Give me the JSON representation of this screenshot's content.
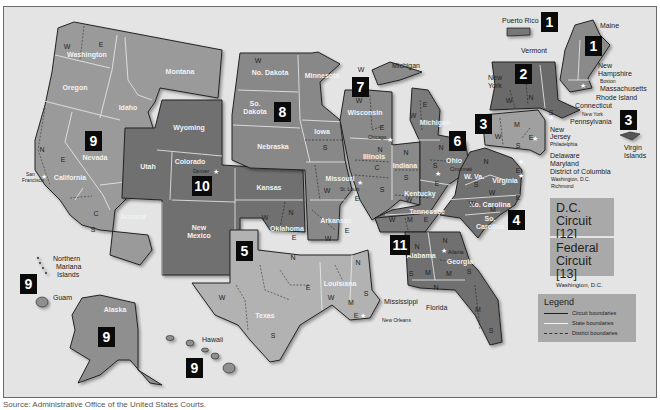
{
  "map": {
    "title": "U.S. Federal Judicial Circuits",
    "colors": {
      "background": "#e4e4e4",
      "circuit_dark": "#6f6f6f",
      "circuit_mid": "#8a8a8a",
      "circuit_light": "#a8a8a8",
      "circuit_boundary": "#222222",
      "state_boundary": "#eeeeee",
      "badge": "#0a0a0a"
    },
    "circuit_badges": [
      {
        "number": "1",
        "location": "Puerto Rico"
      },
      {
        "number": "1",
        "location": "New England"
      },
      {
        "number": "2",
        "location": "New York"
      },
      {
        "number": "3",
        "location": "Pennsylvania"
      },
      {
        "number": "3",
        "location": "Virgin Islands"
      },
      {
        "number": "4",
        "location": "So. Carolina"
      },
      {
        "number": "5",
        "location": "Texas"
      },
      {
        "number": "6",
        "location": "Ohio"
      },
      {
        "number": "7",
        "location": "Wisconsin"
      },
      {
        "number": "8",
        "location": "So. Dakota"
      },
      {
        "number": "9",
        "location": "Nevada"
      },
      {
        "number": "9",
        "location": "Northern Mariana Islands"
      },
      {
        "number": "9",
        "location": "Alaska"
      },
      {
        "number": "9",
        "location": "Hawaii"
      },
      {
        "number": "10",
        "location": "Colorado"
      },
      {
        "number": "11",
        "location": "Alabama"
      }
    ],
    "states": {
      "washington": "Washington",
      "oregon": "Oregon",
      "california": "California",
      "nevada": "Nevada",
      "idaho": "Idaho",
      "montana": "Montana",
      "arizona": "Arizona",
      "alaska": "Alaska",
      "hawaii": "Hawaii",
      "wyoming": "Wyoming",
      "utah": "Utah",
      "colorado": "Colorado",
      "new_mexico_1": "New",
      "new_mexico_2": "Mexico",
      "kansas": "Kansas",
      "oklahoma": "Oklahoma",
      "north_dakota": "No. Dakota",
      "south_dakota_1": "So.",
      "south_dakota_2": "Dakota",
      "nebraska": "Nebraska",
      "minnesota": "Minnesota",
      "iowa": "Iowa",
      "missouri": "Missouri",
      "arkansas": "Arkansas",
      "texas": "Texas",
      "louisiana": "Louisiana",
      "mississippi": "Mississippi",
      "wisconsin": "Wisconsin",
      "illinois": "Illinois",
      "indiana": "Indiana",
      "michigan": "Michigan",
      "michigan_up": "Michigan",
      "ohio": "Ohio",
      "kentucky": "Kentucky",
      "tennessee": "Tennessee",
      "west_virginia": "W. Va.",
      "virginia": "Virginia",
      "north_carolina": "No. Carolina",
      "south_carolina_1": "So.",
      "south_carolina_2": "Carolina",
      "alabama": "Alabama",
      "georgia": "Georgia",
      "florida": "Florida",
      "new_york_1": "New",
      "new_york_2": "York",
      "vermont": "Vermont",
      "maine": "Maine",
      "new_hampshire_1": "New",
      "new_hampshire_2": "Hampshire",
      "massachusetts": "Massachusetts",
      "rhode_island": "Rhode Island",
      "connecticut": "Connecticut",
      "pennsylvania": "Pennsylvania",
      "new_jersey_1": "New",
      "new_jersey_2": "Jersey",
      "delaware": "Delaware",
      "maryland": "Maryland",
      "district_of_columbia": "District of Columbia"
    },
    "territories": {
      "puerto_rico": "Puerto Rico",
      "virgin_islands_1": "Virgin",
      "virgin_islands_2": "Islands",
      "northern_mariana_1": "Northern",
      "northern_mariana_2": "Mariana",
      "northern_mariana_3": "Islands",
      "guam": "Guam"
    },
    "cities": {
      "san_francisco_1": "San",
      "san_francisco_2": "Francisco",
      "denver": "Denver",
      "st_louis": "St. Louis",
      "chicago": "Chicago",
      "cincinnati": "Cincinnati",
      "new_orleans": "New Orleans",
      "atlanta": "Atlanta",
      "boston": "Boston",
      "new_york": "New York",
      "philadelphia": "Philadelphia",
      "washington_dc": "Washington, D.C.",
      "richmond": "Richmond"
    },
    "district_letters": {
      "n": "N",
      "s": "S",
      "e": "E",
      "w": "W",
      "c": "C",
      "m": "M"
    },
    "dc_circuit": {
      "title_1": "D.C.",
      "title_2": "Circuit [12]",
      "location": "Washington, D.C."
    },
    "federal_circuit": {
      "title_1": "Federal",
      "title_2": "Circuit [13]",
      "location": "Washington, D.C."
    },
    "legend": {
      "title": "Legend",
      "items": [
        {
          "label": "Circuit boundaries",
          "style": "solid-dark"
        },
        {
          "label": "State boundaries",
          "style": "solid-white"
        },
        {
          "label": "District boundaries",
          "style": "dashed"
        }
      ]
    },
    "source": "Source: Administrative Office of the United States Courts."
  }
}
